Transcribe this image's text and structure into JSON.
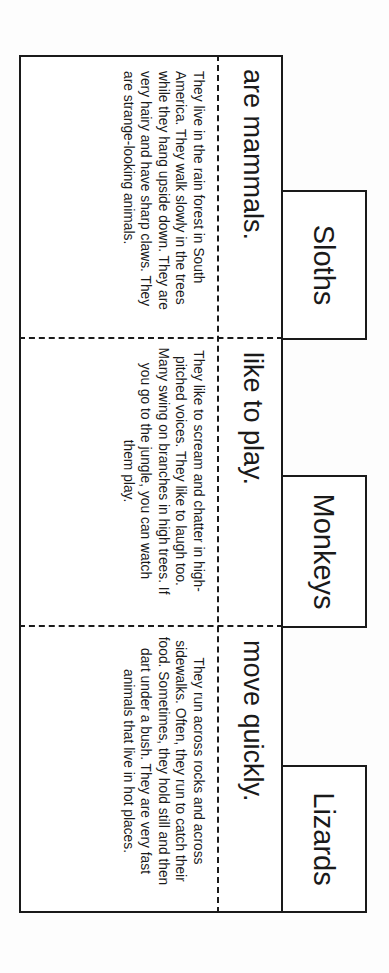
{
  "document": {
    "orientation": "rotated-90-clockwise",
    "panels": [
      {
        "tab_label": "Sloths",
        "subtitle": "are mammals.",
        "description": "They live in the rain forest in South America. They walk slowly in the trees while they hang upside down. They are very hairy and have sharp claws. They are strange-looking animals."
      },
      {
        "tab_label": "Monkeys",
        "subtitle": "like to play.",
        "description": "They like to scream and chatter in high-pitched voices. They like to laugh too. Many swing on branches in high trees. If you go to the jungle, you can watch them play."
      },
      {
        "tab_label": "Lizards",
        "subtitle": "move quickly.",
        "description": "They run across rocks and across sidewalks. Often, they run to catch their food. Sometimes, they hold still and then dart under a bush. They are very fast animals that live in hot places."
      }
    ]
  },
  "colors": {
    "ink": "#1a1a1a",
    "paper": "#ffffff",
    "background": "#fdfdfd"
  }
}
